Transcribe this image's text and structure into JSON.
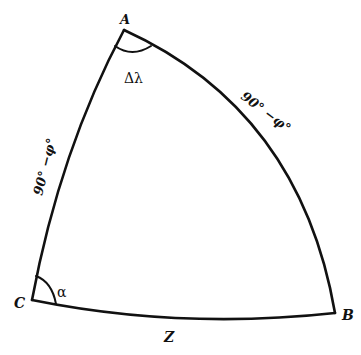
{
  "diagram": {
    "type": "spherical-triangle",
    "vertices": {
      "A": {
        "label": "A"
      },
      "B": {
        "label": "B"
      },
      "C": {
        "label": "C"
      }
    },
    "sides": {
      "AC": {
        "label": "90° −φ°"
      },
      "AB": {
        "label": "90° −φ°"
      },
      "CB": {
        "label": "Z"
      }
    },
    "angles": {
      "A": {
        "label": "Δλ"
      },
      "C": {
        "label": "α"
      }
    },
    "colors": {
      "stroke": "#111111",
      "background": "#ffffff"
    }
  }
}
